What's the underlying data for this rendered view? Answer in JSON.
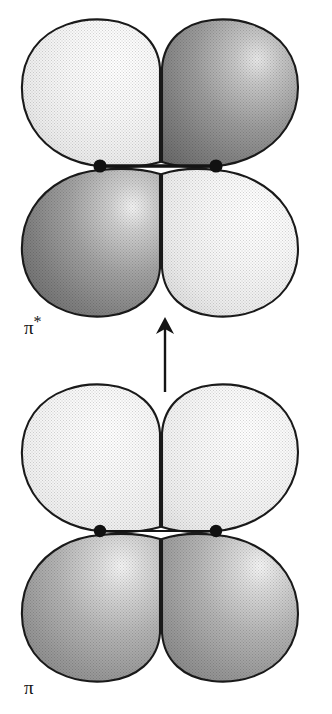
{
  "figure": {
    "background_color": "#ffffff",
    "outline_color": "#1a1a1a",
    "nucleus_color": "#111111",
    "bond_line_color": "#141414",
    "arrow_color": "#141414"
  },
  "labels": {
    "antibonding": {
      "symbol": "π",
      "superscript": "*",
      "full": "π*",
      "meaning": "antibonding pi molecular orbital"
    },
    "bonding": {
      "symbol": "π",
      "superscript": "",
      "full": "π",
      "meaning": "bonding pi molecular orbital"
    }
  },
  "transition_arrow": {
    "direction": "up",
    "from": "pi",
    "to": "pi-star",
    "description": "vertical excitation arrow pointing from the pi orbital up to the pi* orbital"
  },
  "orbitals": [
    {
      "id": "pi-star",
      "name": "antibonding",
      "label": "π*",
      "nodes_between_nuclei": true,
      "nuclei": [
        {
          "id": "left-nucleus",
          "cx": 100,
          "cy": 166
        },
        {
          "id": "right-nucleus",
          "cx": 216,
          "cy": 166
        }
      ],
      "bond_line": {
        "x1": 100,
        "y1": 166,
        "x2": 216,
        "y2": 166
      },
      "lobes": [
        {
          "id": "top-left",
          "phase": "light",
          "shade": "light",
          "fill_light": "#fdfdfd",
          "fill_dark": "#d6d6d6"
        },
        {
          "id": "top-right",
          "phase": "dark",
          "shade": "dark",
          "fill_light": "#c9c9c9",
          "fill_dark": "#6e6e6e"
        },
        {
          "id": "bottom-left",
          "phase": "dark",
          "shade": "dark",
          "fill_light": "#c9c9c9",
          "fill_dark": "#6e6e6e"
        },
        {
          "id": "bottom-right",
          "phase": "light",
          "shade": "light",
          "fill_light": "#fdfdfd",
          "fill_dark": "#d6d6d6"
        }
      ]
    },
    {
      "id": "pi",
      "name": "bonding",
      "label": "π",
      "nodes_between_nuclei": false,
      "nuclei": [
        {
          "id": "left-nucleus",
          "cx": 100,
          "cy": 531
        },
        {
          "id": "right-nucleus",
          "cx": 216,
          "cy": 531
        }
      ],
      "bond_line": {
        "x1": 100,
        "y1": 531,
        "x2": 216,
        "y2": 531
      },
      "lobes": [
        {
          "id": "top-left",
          "phase": "light",
          "shade": "light",
          "fill_light": "#fdfdfd",
          "fill_dark": "#dcdcdc"
        },
        {
          "id": "top-right",
          "phase": "light",
          "shade": "light",
          "fill_light": "#fdfdfd",
          "fill_dark": "#dcdcdc"
        },
        {
          "id": "bottom-left",
          "phase": "dark",
          "shade": "medium",
          "fill_light": "#e2e2e2",
          "fill_dark": "#868686"
        },
        {
          "id": "bottom-right",
          "phase": "dark",
          "shade": "medium",
          "fill_light": "#e2e2e2",
          "fill_dark": "#868686"
        }
      ]
    }
  ]
}
